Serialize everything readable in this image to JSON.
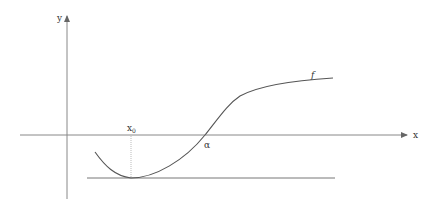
{
  "figure": {
    "width": 425,
    "height": 201,
    "background": "#ffffff",
    "stroke_color": "#666666",
    "curve_color": "#555555",
    "label_color": "#333333",
    "x_axis": {
      "label": "x",
      "y": 135,
      "x_start": 20,
      "x_end": 408
    },
    "y_axis": {
      "label": "y",
      "x": 67,
      "y_start": 199,
      "y_end": 15
    },
    "curve": {
      "name": "f",
      "label": "f",
      "path": "M95,152 C105,166 115,176 131,178 C155,178 185,160 205,135 C220,116 228,104 240,96 C262,84 300,80 333,78"
    },
    "minimum": {
      "label": "x0",
      "label_main": "x",
      "label_sub": "0",
      "x": 131,
      "y": 178
    },
    "tangent_line": {
      "y": 178,
      "x_start": 87,
      "x_end": 335
    },
    "root": {
      "label": "α",
      "x": 205,
      "y": 135
    }
  }
}
